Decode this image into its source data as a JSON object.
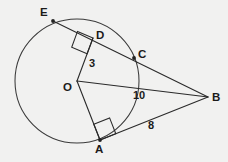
{
  "diagram": {
    "type": "circle-tangent-secant-geometry",
    "background_color": "#f1f1f0",
    "stroke_color": "#2a2a2a",
    "label_color": "#1b1b1b",
    "circle": {
      "center_label": "O",
      "center_x": 77,
      "center_y": 81,
      "radius": 62
    },
    "points": [
      {
        "id": "E",
        "label": "E",
        "x": 53,
        "y": 21,
        "label_x": 40,
        "label_y": 7,
        "on_circle": true,
        "dot": true
      },
      {
        "id": "D",
        "label": "D",
        "x": 93,
        "y": 38,
        "label_x": 96,
        "label_y": 30,
        "on_circle": false,
        "dot": false
      },
      {
        "id": "C",
        "label": "C",
        "x": 134,
        "y": 58,
        "label_x": 138,
        "label_y": 49,
        "on_circle": true,
        "dot": true
      },
      {
        "id": "O",
        "label": "O",
        "x": 77,
        "y": 81,
        "label_x": 63,
        "label_y": 82,
        "on_circle": false,
        "dot": false
      },
      {
        "id": "B",
        "label": "B",
        "x": 208,
        "y": 97,
        "label_x": 212,
        "label_y": 92,
        "on_circle": false,
        "dot": false
      },
      {
        "id": "A",
        "label": "A",
        "x": 100,
        "y": 140,
        "label_x": 95,
        "label_y": 144,
        "on_circle": true,
        "dot": true
      }
    ],
    "segments": [
      {
        "name": "segment-E-B",
        "from": "E",
        "to": "B"
      },
      {
        "name": "segment-O-D",
        "from": "O",
        "to": "D"
      },
      {
        "name": "segment-O-B",
        "from": "O",
        "to": "B"
      },
      {
        "name": "segment-O-A",
        "from": "O",
        "to": "A"
      },
      {
        "name": "segment-A-B",
        "from": "A",
        "to": "B"
      }
    ],
    "right_angles": [
      {
        "name": "right-angle-at-D",
        "vertex": "D"
      },
      {
        "name": "right-angle-at-A",
        "vertex": "A"
      }
    ],
    "measures": [
      {
        "name": "length-label-3",
        "value": "3",
        "x": 89,
        "y": 58,
        "segment": "O-D"
      },
      {
        "name": "length-label-10",
        "value": "10",
        "x": 133,
        "y": 90,
        "segment": "O-B"
      },
      {
        "name": "length-label-8",
        "value": "8",
        "x": 148,
        "y": 120,
        "segment": "A-B"
      }
    ]
  }
}
